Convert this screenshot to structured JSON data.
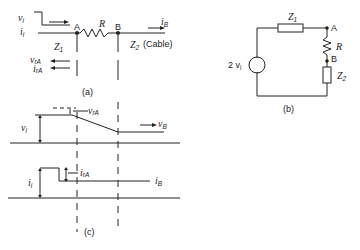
{
  "panel_a": {
    "caption": "(a)",
    "labels": {
      "vi": "v",
      "vi_sub": "i",
      "ii": "i",
      "ii_sub": "i",
      "node_a": "A",
      "resistor": "R",
      "node_b": "B",
      "z1": "Z",
      "z1_sub": "1",
      "z2": "Z",
      "z2_sub": "2",
      "z2_note": "(Cable)",
      "ib": "i",
      "ib_sub": "B",
      "vra": "v",
      "vra_sub": "rA",
      "ira": "i",
      "ira_sub": "rA"
    }
  },
  "panel_b": {
    "caption": "(b)",
    "labels": {
      "source": "2 v",
      "source_sub": "i",
      "z1": "Z",
      "z1_sub": "1",
      "node_a": "A",
      "resistor": "R",
      "node_b": "B",
      "z2": "Z",
      "z2_sub": "2"
    }
  },
  "panel_c": {
    "caption": "(c)",
    "labels": {
      "vi": "v",
      "vi_sub": "i",
      "vra": "v",
      "vra_sub": "rA",
      "vb": "v",
      "vb_sub": "B",
      "ii": "i",
      "ii_sub": "i",
      "ira": "i",
      "ira_sub": "rA",
      "ib": "i",
      "ib_sub": "B"
    }
  }
}
